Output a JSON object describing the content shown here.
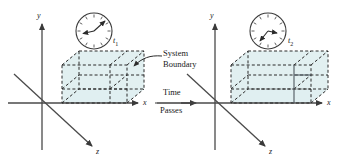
{
  "figure": {
    "type": "thermodynamic-system-diagram",
    "background": "#ffffff",
    "stroke_color": "#3a3a3a",
    "dashed_color": "#2b2b2b",
    "fill_color": "#dfeef0",
    "fill_opacity": 0.85
  },
  "left_panel": {
    "axes": {
      "y_label": "y",
      "x_label": "x",
      "z_label": "z"
    },
    "clock": {
      "label": "t",
      "subscript": "1",
      "hand_a_deg": 40,
      "hand_b_deg": 255
    },
    "box_state": "initial"
  },
  "right_panel": {
    "axes": {
      "y_label": "y",
      "x_label": "x",
      "z_label": "z"
    },
    "clock": {
      "label": "t",
      "subscript": "2",
      "hand_a_deg": 95,
      "hand_b_deg": 215
    },
    "box_state": "expanded"
  },
  "annotations": {
    "system_boundary_line1": "System",
    "system_boundary_line2": "Boundary",
    "time_passes_line1": "Time",
    "time_passes_line2": "Passes"
  }
}
